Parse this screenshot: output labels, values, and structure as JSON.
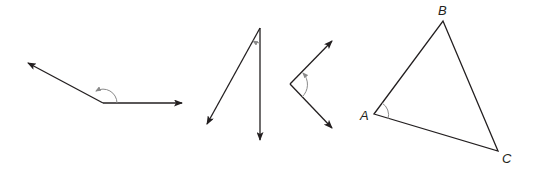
{
  "figure": {
    "type": "angle-diagrams",
    "colors": {
      "line": "#231f20",
      "arc": "#8a8a8a",
      "background": "#ffffff"
    },
    "angles": [
      {
        "id": "obtuse-angle",
        "vertex": [
          103,
          103
        ],
        "ray_ends": [
          [
            28,
            63
          ],
          [
            182,
            103
          ]
        ],
        "arc_radius": 14
      },
      {
        "id": "acute-angle-narrow",
        "vertex": [
          260,
          28
        ],
        "ray_ends": [
          [
            207,
            124
          ],
          [
            260,
            140
          ]
        ],
        "arc_radius": 14
      },
      {
        "id": "acute-angle-right-opening",
        "vertex": [
          290,
          84
        ],
        "ray_ends": [
          [
            332,
            41
          ],
          [
            332,
            128
          ]
        ],
        "arc_radius": 16
      }
    ],
    "triangle": {
      "vertices": {
        "A": [
          374,
          114
        ],
        "B": [
          443,
          21
        ],
        "C": [
          498,
          151
        ]
      },
      "labels": {
        "A": "A",
        "B": "B",
        "C": "C"
      },
      "marked_angle": "A"
    }
  }
}
